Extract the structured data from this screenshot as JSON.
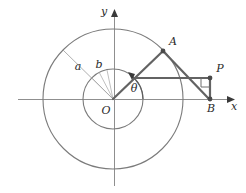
{
  "figure": {
    "type": "geometry-diagram",
    "background_color": "#ffffff",
    "stroke_color": "#767676",
    "bold_stroke_color": "#5e5e5e",
    "axis_color": "#8a8a8a",
    "text_color": "#2a2a2a"
  },
  "axes": {
    "x_label": "x",
    "y_label": "y",
    "origin_label": "O",
    "origin": {
      "x": 113,
      "y": 99
    },
    "x_axis": {
      "x1": 18,
      "x2": 232,
      "y": 99
    },
    "y_axis": {
      "x": 114,
      "y1": 14,
      "y2": 186
    }
  },
  "circles": [
    {
      "name": "outer-circle",
      "radius_label": "a",
      "cx": 113,
      "cy": 99,
      "r": 70
    },
    {
      "name": "inner-circle",
      "radius_label": "b",
      "cx": 113,
      "cy": 99,
      "r": 30
    }
  ],
  "radius_labels": {
    "outer": "a",
    "inner": "b"
  },
  "angle": {
    "label": "θ",
    "value_text": "θ"
  },
  "points": [
    {
      "name": "point-a",
      "label": "A",
      "x": 163,
      "y": 51
    },
    {
      "name": "point-p",
      "label": "P",
      "x": 210,
      "y": 78
    },
    {
      "name": "point-b",
      "label": "B",
      "x": 210,
      "y": 99
    }
  ],
  "segments": [
    {
      "name": "segment-oa",
      "from": "O",
      "to": "A"
    },
    {
      "name": "segment-horizontal",
      "from": "inner-circle",
      "to": "P"
    },
    {
      "name": "segment-ab",
      "from": "A",
      "to": "B"
    },
    {
      "name": "segment-pb",
      "from": "P",
      "to": "B"
    }
  ],
  "markers": {
    "right_angle_at": "P"
  }
}
